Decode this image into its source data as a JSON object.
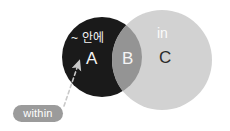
{
  "canvas": {
    "width": 230,
    "height": 131,
    "background": "#ffffff"
  },
  "diagram": {
    "type": "venn",
    "title_visible": false,
    "sets": [
      {
        "id": "dark",
        "region_label": "A",
        "fill": "#1a1a1a",
        "cx": 102,
        "cy": 57,
        "r": 40,
        "annotation": "~ 안에",
        "annotation_color": "#f2f2f2",
        "label_color": "#f4f4f4"
      },
      {
        "id": "light",
        "region_label": "C",
        "fill": "#d2d2d2",
        "cx": 162,
        "cy": 60,
        "r": 50,
        "annotation": "in",
        "annotation_color": "#fbfbfb",
        "label_color": "#2a2a2a"
      }
    ],
    "intersection": {
      "region_label": "B",
      "fill": "#949494",
      "label_color": "#f4f4f4"
    }
  },
  "callout": {
    "pill_label": "within",
    "pill_fill": "#9b9b9b",
    "pill_text_color": "#ffffff",
    "arrow_color": "#c9c9c9",
    "arrow_style": "dashed",
    "arrow_points_to": "A"
  }
}
